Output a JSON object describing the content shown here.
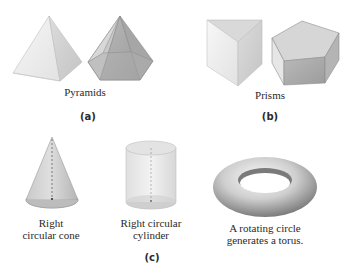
{
  "groups": [
    {
      "tag": "(a)",
      "caption": "Pyramids",
      "shapes": [
        "square-pyramid",
        "pentagonal-pyramid"
      ]
    },
    {
      "tag": "(b)",
      "caption": "Prisms",
      "shapes": [
        "triangular-prism",
        "pentagonal-prism"
      ]
    },
    {
      "tag": "(c)",
      "items": [
        {
          "shape": "right-circular-cone",
          "line1": "Right",
          "line2": "circular cone"
        },
        {
          "shape": "right-circular-cylinder",
          "line1": "Right circular",
          "line2": "cylinder"
        },
        {
          "shape": "torus",
          "line1": "A rotating circle",
          "line2": "generates a torus."
        }
      ]
    }
  ],
  "colors": {
    "light_face": "#ececec",
    "mid_face": "#d2d2d2",
    "dark_face": "#a9a9a9",
    "edge": "#8a8a8a"
  }
}
